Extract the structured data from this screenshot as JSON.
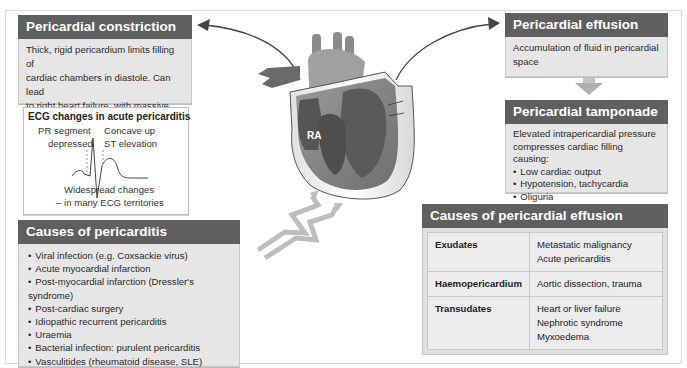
{
  "constriction": {
    "title": "Pericardial constriction",
    "lines": [
      "Thick, rigid pericardium limits filling of",
      "cardiac chambers in diastole. Can lead",
      "to right heart failure, with massive",
      "ascites, minimal ankle oedema"
    ]
  },
  "ecg": {
    "title": "ECG changes in acute pericarditis",
    "pr_label_1": "PR segment",
    "pr_label_2": "depressed",
    "st_label_1": "Concave up",
    "st_label_2": "ST elevation",
    "bottom_1": "Widespread changes",
    "bottom_2": "– in many ECG territories"
  },
  "pericarditis": {
    "title": "Causes of pericarditis",
    "items": [
      "Viral infection (e.g. Coxsackie virus)",
      "Acute myocardial infarction",
      "Post-myocardial infarction (Dressler's syndrome)",
      "Post-cardiac surgery",
      "Idiopathic recurrent pericarditis",
      "Uraemia",
      "Bacterial infection: purulent pericarditis",
      "Vasculitides (rheumatoid disease, SLE)"
    ]
  },
  "heart": {
    "label_ra": "RA"
  },
  "effusion": {
    "title": "Pericardial effusion",
    "lines": [
      "Accumulation of fluid in pericardial",
      "space"
    ]
  },
  "tamponade": {
    "title": "Pericardial tamponade",
    "lines": [
      "Elevated intrapericardial pressure",
      "compresses cardiac filling causing:"
    ],
    "items": [
      "Low cardiac output",
      "Hypotension, tachycardia",
      "Oliguria"
    ]
  },
  "effusion_causes": {
    "title": "Causes of pericardial effusion",
    "rows": [
      {
        "key": "Exudates",
        "values": [
          "Metastatic malignancy",
          "Acute pericarditis"
        ]
      },
      {
        "key": "Haemopericardium",
        "values": [
          "Aortic dissection, trauma"
        ]
      },
      {
        "key": "Transudates",
        "values": [
          "Heart or liver failure",
          "Nephrotic syndrome",
          "Myxoedema"
        ]
      }
    ]
  },
  "colors": {
    "header_bg": "#5f5f5f",
    "body_bg": "#e6e6e6",
    "border": "#c8c8c8",
    "arrow_gray": "#b5b5b5"
  }
}
